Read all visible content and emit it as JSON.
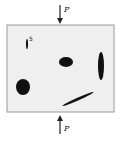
{
  "diagram": {
    "load_top_label": "P",
    "load_bottom_label": "P",
    "slit_label": "5",
    "colors": {
      "plate_fill": "#efefef",
      "plate_border": "#9a9a9a",
      "hole_fill": "#111111",
      "arrow": "#222222"
    }
  }
}
